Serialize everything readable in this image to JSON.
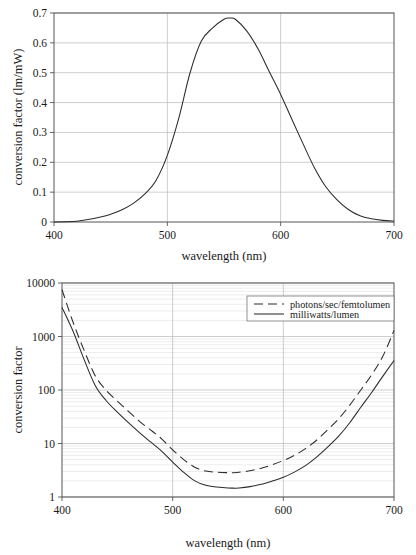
{
  "figure": {
    "panels": [
      {
        "name": "luminous-efficacy-linear",
        "axis": {
          "x_title": "wavelength (nm)",
          "y_title": "conversion factor (lm/mW)",
          "x_ticks": [
            "400",
            "500",
            "600",
            "700"
          ],
          "y_ticks": [
            "0",
            "0.1",
            "0.2",
            "0.3",
            "0.4",
            "0.5",
            "0.6",
            "0.7"
          ]
        }
      },
      {
        "name": "conversion-factor-log",
        "axis": {
          "x_title": "wavelength (nm)",
          "y_title": "conversion factor",
          "x_ticks": [
            "400",
            "500",
            "600",
            "700"
          ],
          "y_ticks": [
            "1",
            "10",
            "100",
            "1000",
            "10000"
          ]
        },
        "legend": {
          "entries": [
            {
              "label": "photons/sec/femtolumen",
              "style": "dashed"
            },
            {
              "label": "milliwatts/lumen",
              "style": "solid"
            }
          ]
        }
      }
    ]
  },
  "chart_data": [
    {
      "type": "line",
      "name": "photopic-luminous-efficacy",
      "title": "",
      "xlabel": "wavelength (nm)",
      "ylabel": "conversion factor (lm/mW)",
      "xscale": "linear",
      "yscale": "linear",
      "xlim": [
        400,
        700
      ],
      "ylim": [
        0,
        0.7
      ],
      "xticks": [
        400,
        500,
        600,
        700
      ],
      "yticks": [
        0,
        0.1,
        0.2,
        0.3,
        0.4,
        0.5,
        0.6,
        0.7
      ],
      "grid": "horizontal-major-and-vertical-major",
      "legend": "none",
      "peak": {
        "x": 555,
        "y": 0.683
      },
      "x": [
        400,
        410,
        420,
        430,
        440,
        450,
        460,
        470,
        480,
        490,
        500,
        510,
        520,
        530,
        540,
        550,
        555,
        560,
        570,
        580,
        590,
        600,
        610,
        620,
        630,
        640,
        650,
        660,
        670,
        680,
        690,
        700
      ],
      "series": [
        {
          "name": "luminous efficacy (lm/mW)",
          "style": "solid",
          "values": [
            0.0002,
            0.0008,
            0.0027,
            0.0082,
            0.0159,
            0.026,
            0.0409,
            0.0626,
            0.0932,
            0.139,
            0.223,
            0.346,
            0.499,
            0.606,
            0.65,
            0.679,
            0.683,
            0.679,
            0.64,
            0.58,
            0.503,
            0.427,
            0.343,
            0.26,
            0.18,
            0.117,
            0.073,
            0.041,
            0.021,
            0.011,
            0.0055,
            0.0028
          ]
        }
      ]
    },
    {
      "type": "line",
      "name": "conversion-factors-log",
      "title": "",
      "xlabel": "wavelength (nm)",
      "ylabel": "conversion factor",
      "xscale": "linear",
      "yscale": "log",
      "xlim": [
        400,
        700
      ],
      "ylim": [
        1,
        10000
      ],
      "xticks": [
        400,
        500,
        600,
        700
      ],
      "yticks": [
        1,
        10,
        100,
        1000,
        10000
      ],
      "grid": "log-minor-horizontal-and-vertical-major",
      "legend": "top-right",
      "x": [
        400,
        410,
        420,
        430,
        440,
        450,
        460,
        470,
        480,
        490,
        500,
        510,
        520,
        530,
        540,
        550,
        555,
        560,
        570,
        580,
        590,
        600,
        610,
        620,
        630,
        640,
        650,
        660,
        670,
        680,
        690,
        700
      ],
      "series": [
        {
          "name": "photons/sec/femtolumen",
          "style": "dashed",
          "values": [
            7500,
            1850,
            550,
            185,
            98,
            62,
            40,
            26,
            18,
            12.2,
            7.6,
            5.0,
            3.6,
            3.05,
            2.9,
            2.85,
            2.85,
            2.9,
            3.1,
            3.45,
            4.0,
            4.8,
            6.0,
            8.0,
            11.5,
            18,
            29,
            52,
            100,
            195,
            430,
            1300
          ]
        },
        {
          "name": "milliwatts/lumen",
          "style": "solid",
          "values": [
            3500,
            1250,
            370,
            122,
            63,
            38.5,
            24.5,
            16.0,
            10.7,
            7.2,
            4.5,
            2.89,
            2.0,
            1.65,
            1.54,
            1.473,
            1.464,
            1.473,
            1.563,
            1.724,
            1.99,
            2.34,
            2.92,
            3.85,
            5.56,
            8.55,
            13.7,
            24.4,
            47.6,
            91,
            182,
            357
          ]
        }
      ]
    }
  ]
}
